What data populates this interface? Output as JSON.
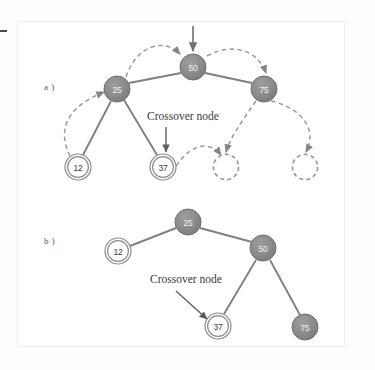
{
  "figure": {
    "caption_labels": {
      "a": "a )",
      "b": "b )"
    },
    "annotation_text": "Crossover node",
    "colors": {
      "filled_node": "#8c8c8e",
      "filled_node_stroke": "#707072",
      "open_node_stroke": "#8a8a8c",
      "edge": "#7f7f86",
      "dashed": "#9a9a9c",
      "text_dark": "#3b3b3d",
      "text_light": "#f4f4f4",
      "panel_bg": "#ffffff",
      "page_bg": "#fdfdfd"
    },
    "node_radius": {
      "filled": 13,
      "open_outer": 13,
      "open_inner": 10.5
    }
  },
  "panel_a": {
    "label": "a )",
    "annotation": "Crossover node",
    "nodes": [
      {
        "id": "a-50",
        "value": "50",
        "style": "filled",
        "cx": 193,
        "cy": 67
      },
      {
        "id": "a-25",
        "value": "25",
        "style": "filled",
        "cx": 117,
        "cy": 89
      },
      {
        "id": "a-75",
        "value": "75",
        "style": "filled",
        "cx": 264,
        "cy": 89
      },
      {
        "id": "a-12",
        "value": "12",
        "style": "open",
        "cx": 78,
        "cy": 167
      },
      {
        "id": "a-37",
        "value": "37",
        "style": "open",
        "cx": 163,
        "cy": 167
      },
      {
        "id": "a-empty-1",
        "value": "",
        "style": "dashed-empty",
        "cx": 226,
        "cy": 167
      },
      {
        "id": "a-empty-2",
        "value": "",
        "style": "dashed-empty",
        "cx": 305,
        "cy": 167
      }
    ],
    "edges": [
      {
        "from": "a-50",
        "to": "a-25"
      },
      {
        "from": "a-50",
        "to": "a-75"
      },
      {
        "from": "a-25",
        "to": "a-12"
      },
      {
        "from": "a-25",
        "to": "a-37"
      }
    ],
    "root_pointer": {
      "from_y": 26,
      "to_y": 52,
      "x": 193
    }
  },
  "panel_b": {
    "label": "b )",
    "annotation": "Crossover node",
    "nodes": [
      {
        "id": "b-25",
        "value": "25",
        "style": "filled",
        "cx": 188,
        "cy": 222
      },
      {
        "id": "b-12",
        "value": "12",
        "style": "open",
        "cx": 118,
        "cy": 251
      },
      {
        "id": "b-50",
        "value": "50",
        "style": "filled",
        "cx": 263,
        "cy": 248
      },
      {
        "id": "b-37",
        "value": "37",
        "style": "open",
        "cx": 218,
        "cy": 326
      },
      {
        "id": "b-75",
        "value": "75",
        "style": "filled",
        "cx": 305,
        "cy": 327
      }
    ],
    "edges": [
      {
        "from": "b-25",
        "to": "b-12"
      },
      {
        "from": "b-25",
        "to": "b-50"
      },
      {
        "from": "b-50",
        "to": "b-37"
      },
      {
        "from": "b-50",
        "to": "b-75"
      }
    ]
  }
}
